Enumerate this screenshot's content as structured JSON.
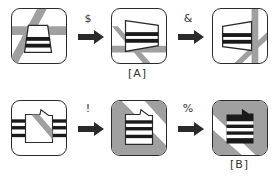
{
  "diagram": {
    "rows": [
      {
        "panels": [
          {
            "id": "p1",
            "label": ""
          },
          {
            "id": "p2",
            "label": "[A]"
          },
          {
            "id": "p3",
            "label": ""
          }
        ],
        "transitions": [
          "$",
          "&"
        ]
      },
      {
        "panels": [
          {
            "id": "p4",
            "label": ""
          },
          {
            "id": "p5",
            "label": ""
          },
          {
            "id": "p6",
            "label": "[B]"
          }
        ],
        "transitions": [
          "!",
          "%"
        ]
      }
    ],
    "colors": {
      "stroke": "#2a2a2a",
      "gray": "#9a9a9a",
      "black": "#1a1a1a",
      "white": "#ffffff"
    }
  }
}
